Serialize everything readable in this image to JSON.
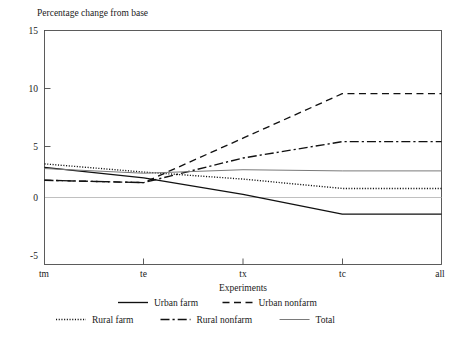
{
  "chart_data": {
    "type": "line",
    "title": "",
    "ylabel": "Percentage change from base",
    "xlabel": "Experiments",
    "categories": [
      "tm",
      "te",
      "tx",
      "tc",
      "all"
    ],
    "yticks": [
      "-5",
      "0",
      "5",
      "10",
      "15"
    ],
    "ylim": [
      -5,
      15
    ],
    "grid": false,
    "zero_line": true,
    "legend_position": "bottom",
    "series": [
      {
        "name": "Urban farm",
        "style": "solid",
        "values": [
          3.3,
          2.4,
          1.0,
          -0.7,
          -0.7
        ]
      },
      {
        "name": "Urban nonfarm",
        "style": "dashed",
        "values": [
          2.2,
          2.0,
          5.8,
          9.6,
          9.6
        ]
      },
      {
        "name": "Rural farm",
        "style": "dotted",
        "values": [
          3.6,
          2.9,
          2.3,
          1.5,
          1.5
        ]
      },
      {
        "name": "Rural nonfarm",
        "style": "dashdot",
        "values": [
          2.2,
          2.0,
          4.1,
          5.5,
          5.5
        ]
      },
      {
        "name": "Total",
        "style": "solid-thin",
        "values": [
          3.2,
          2.8,
          3.1,
          3.0,
          3.0
        ]
      }
    ]
  },
  "legend": {
    "entries": [
      {
        "label": "Urban farm",
        "style": "solid"
      },
      {
        "label": "Urban nonfarm",
        "style": "dashed"
      },
      {
        "label": "Rural farm",
        "style": "dotted"
      },
      {
        "label": "Rural nonfarm",
        "style": "dashdot"
      },
      {
        "label": "Total",
        "style": "solid-thin"
      }
    ]
  }
}
